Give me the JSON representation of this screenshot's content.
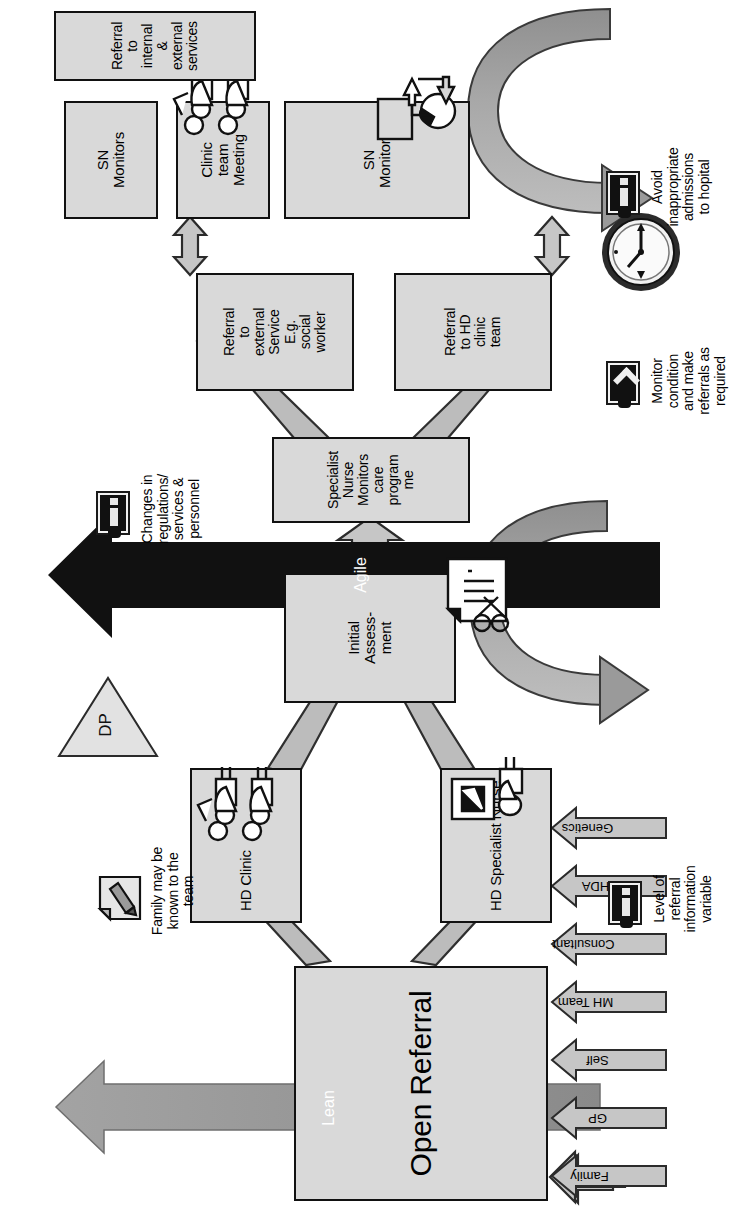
{
  "diagram": {
    "orientation": "landscape content rotated 90 degrees counter-clockwise on a portrait page",
    "colors": {
      "box_fill": "#d9d9d9",
      "box_border": "#111111",
      "arrow_fill": "#bfbfbf",
      "arrow_border": "#333333",
      "lean_arrow": "#8c8c8c",
      "agile_arrow": "#111111",
      "icon_dark": "#111111",
      "page_background": "#ffffff"
    },
    "inputs": {
      "label": "Referral sources",
      "items": [
        {
          "label": "Family"
        },
        {
          "label": "GP"
        },
        {
          "label": "Self"
        },
        {
          "label": "MH Team"
        },
        {
          "label": "Consultant"
        },
        {
          "label": "HDA"
        },
        {
          "label": "Genetics"
        }
      ]
    },
    "nodes": {
      "open_referral": "Open Referral",
      "hd_clinic": "HD Clinic",
      "hd_specialist_nurse": "HD Specialist Nurse",
      "initial_assessment": "Initial Assess- ment",
      "initial_assessment_lines": [
        "Initial",
        "Assess-",
        "ment"
      ],
      "specialist_nurse_monitors": "Specialist Nurse Monitors care programme",
      "specialist_nurse_monitors_lines": [
        "Specialist",
        "Nurse",
        "Monitors",
        "care",
        "program",
        "me"
      ],
      "referral_external_service": "Referral to external Service E.g. social worker",
      "referral_external_service_lines": [
        "Referral",
        "to",
        "external",
        "Service",
        "E.g.",
        "social",
        "worker"
      ],
      "referral_hd_clinic_team": "Referral to HD clinic team",
      "referral_hd_clinic_team_lines": [
        "Referral",
        "to HD",
        "clinic",
        "team"
      ],
      "sn_monitors_1": "SN Monitors",
      "sn_monitors_1_lines": [
        "SN",
        "Monitors"
      ],
      "clinic_team_meeting": "Clinic team Meeting",
      "clinic_team_meeting_lines": [
        "Clinic",
        "team",
        "Meeting"
      ],
      "sn_monitors_2": "SN Monitors",
      "sn_monitors_2_lines": [
        "SN",
        "Monitors"
      ],
      "referral_internal_external": "Referral to internal & external services",
      "referral_internal_external_lines": [
        "Referral",
        "to",
        "internal",
        "&",
        "external",
        "services"
      ]
    },
    "annotations": [
      {
        "id": "family-known",
        "icon": "document-pencil-icon",
        "lines": [
          "Family may be",
          "known to the",
          "team"
        ],
        "text": "Family may be known to the team"
      },
      {
        "id": "referral-info-level",
        "icon": "battery-icon",
        "lines": [
          "Level of",
          "referral",
          "information",
          "variable"
        ],
        "text": "Level of referral information variable"
      },
      {
        "id": "changes-regulations",
        "icon": "battery-icon",
        "lines": [
          "Changes in",
          "regulations/",
          "services &",
          "personnel"
        ],
        "text": "Changes in regulations/ services & personnel"
      },
      {
        "id": "monitor-condition",
        "icon": "battery-chevron-icon",
        "lines": [
          "Monitor",
          "condition",
          "and make",
          "referrals as",
          "required"
        ],
        "text": "Monitor condition and make referrals as required"
      },
      {
        "id": "avoid-admissions",
        "icon": "battery-icon",
        "lines": [
          "Avoid",
          "inappropriate",
          "admissions",
          "to hopital"
        ],
        "text": "Avoid inappropriate admissions to hopital"
      }
    ],
    "measures": {
      "lean": "Lean",
      "agile": "Agile",
      "decoupling_point": "DP"
    },
    "icons": {
      "people_group": "people-group-icon",
      "person_with_screen": "person-screen-icon",
      "document_scissors": "document-scissors-icon",
      "document_pencil": "document-pencil-icon",
      "network_phone": "network-node-icon",
      "clock": "clock-icon"
    }
  }
}
